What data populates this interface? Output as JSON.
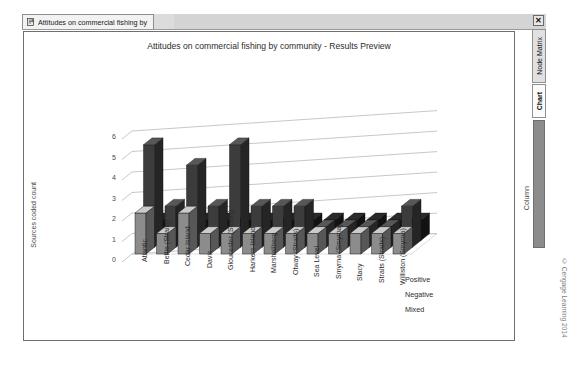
{
  "window": {
    "tab_label": "Attitudes on commercial fishing by",
    "tab_icon": "document-icon",
    "close_label": "✕"
  },
  "right_rail": {
    "tabs": [
      {
        "label": "Node Matrix",
        "selected": false
      },
      {
        "label": "Chart",
        "selected": true
      }
    ],
    "column_label": "Column",
    "copyright": "© Cengage Learning 2014"
  },
  "chart_data": {
    "type": "bar",
    "title": "Attitudes on commercial fishing by community - Results Preview",
    "xlabel": "Row",
    "ylabel": "Sources coded count",
    "ylim": [
      0,
      6
    ],
    "yticks": [
      0,
      1,
      2,
      3,
      4,
      5,
      6
    ],
    "grid": true,
    "legend_position": "right",
    "categories": [
      "Atlantic",
      "Bettie (Straits)",
      "Cedar Island",
      "Davis",
      "Gloucester (Straits)",
      "Harkers Island",
      "Marshallberg",
      "Otway (Straits)",
      "Sea Level",
      "Smyrna (Smyrna)",
      "Stacy",
      "Straits (Straits)",
      "Williston (Smyrna)"
    ],
    "series": [
      {
        "name": "Positive",
        "color": "#8c8c8c",
        "values": [
          2,
          1,
          2,
          1,
          1,
          1,
          1,
          1,
          1,
          1,
          1,
          1,
          1
        ]
      },
      {
        "name": "Negative",
        "color": "#3c3c3c",
        "values": [
          5,
          2,
          4,
          2,
          5,
          2,
          2,
          2,
          1,
          1,
          1,
          1,
          2
        ]
      },
      {
        "name": "Mixed",
        "color": "#1d1d1d",
        "values": [
          1,
          1,
          1,
          1,
          1,
          1,
          1,
          1,
          1,
          1,
          1,
          1,
          1
        ]
      }
    ]
  }
}
